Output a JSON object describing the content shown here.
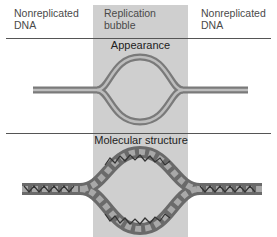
{
  "labels": {
    "left": [
      "Nonreplicated",
      "DNA"
    ],
    "center": [
      "Replication",
      "bubble"
    ],
    "right": [
      "Nonreplicated",
      "DNA"
    ]
  },
  "sections": {
    "appearance": "Appearance",
    "molecular": "Molecular structure"
  },
  "colors": {
    "bubble_shade": "#cfcfcf",
    "tube": "#8a8a8a",
    "tube_highlight": "#b5b5b5",
    "helix_dark": "#555555"
  }
}
